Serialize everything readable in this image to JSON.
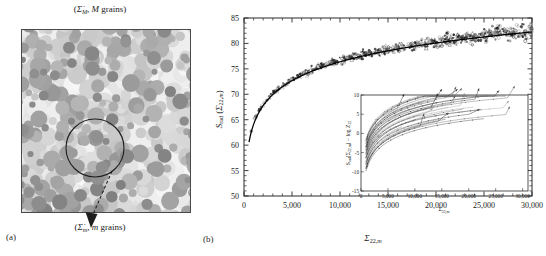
{
  "figure": {
    "panel_a": {
      "label": "(a)",
      "top_annotation": "(Σ̇M, M grains)",
      "bottom_annotation": "(Σ̇m, m grains)",
      "top_annotation_parts": {
        "sigma": "Σ̇",
        "sub": "M",
        "rest": ", M grains"
      },
      "bottom_annotation_parts": {
        "sigma": "Σ̇",
        "sub": "m",
        "rest": ", m grains"
      },
      "description": "random grain microstructure with circular sub-volume callout and dashed arrow"
    },
    "panel_b": {
      "label": "(b)"
    }
  },
  "chart_data": [
    {
      "id": "main-plot",
      "type": "scatter",
      "title": "",
      "xlabel": "Σ22,m",
      "ylabel": "Srad (Σ22,m)",
      "xlim": [
        0,
        30000
      ],
      "ylim": [
        50,
        85
      ],
      "xticks": [
        0,
        5000,
        10000,
        15000,
        20000,
        25000,
        30000
      ],
      "xticklabels": [
        "0",
        "5,000",
        "10,000",
        "15,000",
        "20,000",
        "25,000",
        "30,000"
      ],
      "yticks": [
        50,
        55,
        60,
        65,
        70,
        75,
        80,
        85
      ],
      "yticklabels": [
        "50",
        "55",
        "60",
        "65",
        "70",
        "75",
        "80",
        "85"
      ],
      "grid": false,
      "legend": null,
      "fit_curve": {
        "name": "logarithmic fit",
        "form": "S = a + b*ln(x)",
        "a": 27.2,
        "b": 5.34,
        "x_start": 520,
        "x_end": 30000,
        "color": "#000000"
      },
      "series": [
        {
          "name": "simulated realizations",
          "marker": "mixed open/filled circles and triangles",
          "color": "#3a3a3a",
          "n_points": 640,
          "scatter_sd": 0.55,
          "x_min": 700,
          "x_max": 30000
        }
      ],
      "sample_points": {
        "x": [
          800,
          1200,
          1600,
          2000,
          2600,
          3200,
          4000,
          5000,
          6000,
          7500,
          9000,
          11000,
          13000,
          15000,
          17500,
          20000,
          22500,
          25000,
          27500,
          30000
        ],
        "y": [
          58.0,
          60.9,
          62.6,
          63.8,
          65.3,
          66.4,
          67.7,
          69.0,
          70.0,
          71.2,
          72.2,
          73.4,
          74.2,
          75.0,
          75.8,
          76.5,
          77.2,
          77.7,
          78.2,
          78.6
        ]
      }
    },
    {
      "id": "inset-plot",
      "type": "line",
      "title": "",
      "xlabel": "Σ22,m",
      "ylabel": "Srad (Σ22,m) − log Z22",
      "xlim": [
        0,
        31000
      ],
      "ylim": [
        -15,
        10
      ],
      "xticks": [
        0,
        5000,
        10000,
        15000,
        20000,
        25000,
        30000
      ],
      "xticklabels": [
        "0",
        "5,000",
        "10,000",
        "15,000",
        "20,000",
        "25,000",
        "30,000"
      ],
      "yticks": [
        -15,
        -10,
        -5,
        0,
        5,
        10
      ],
      "yticklabels": [
        "-15",
        "-10",
        "-5",
        "0",
        "5",
        "10"
      ],
      "grid": false,
      "legend": null,
      "n_curves": 34,
      "curve_family": {
        "form": "c + 4.6*ln(x/1000) decaying family with arrow-tipped ends",
        "offset_min": -9.5,
        "offset_max": -2.0,
        "color": "#555555"
      }
    }
  ]
}
